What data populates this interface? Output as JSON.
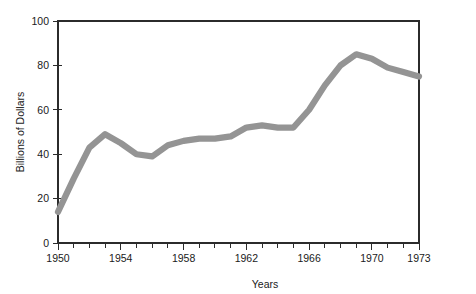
{
  "chart_data": {
    "type": "line",
    "title": "",
    "xlabel": "Years",
    "ylabel": "Billions of Dollars",
    "xlim": [
      1950,
      1973
    ],
    "ylim": [
      0,
      100
    ],
    "grid": false,
    "legend": null,
    "line_color": "#949494",
    "axis_color": "#2b2b2b",
    "x_tick_labels": [
      "1950",
      "1954",
      "1958",
      "1962",
      "1966",
      "1970",
      "1973"
    ],
    "x_tick_values": [
      1950,
      1954,
      1958,
      1962,
      1966,
      1970,
      1973
    ],
    "x_minor_ticks": [
      1950,
      1951,
      1952,
      1953,
      1954,
      1955,
      1956,
      1957,
      1958,
      1959,
      1960,
      1961,
      1962,
      1963,
      1964,
      1965,
      1966,
      1967,
      1968,
      1969,
      1970,
      1971,
      1972,
      1973
    ],
    "y_tick_labels": [
      "0",
      "20",
      "40",
      "60",
      "80",
      "100"
    ],
    "y_tick_values": [
      0,
      20,
      40,
      60,
      80,
      100
    ],
    "x": [
      1950,
      1951,
      1952,
      1953,
      1954,
      1955,
      1956,
      1957,
      1958,
      1959,
      1960,
      1961,
      1962,
      1963,
      1964,
      1965,
      1966,
      1967,
      1968,
      1969,
      1970,
      1971,
      1972,
      1973
    ],
    "values": [
      14,
      29,
      43,
      49,
      45,
      40,
      39,
      44,
      46,
      47,
      47,
      48,
      52,
      53,
      52,
      52,
      60,
      71,
      80,
      85,
      83,
      79,
      77,
      75
    ],
    "series": [
      {
        "name": "Billions of Dollars",
        "values": [
          14,
          29,
          43,
          49,
          45,
          40,
          39,
          44,
          46,
          47,
          47,
          48,
          52,
          53,
          52,
          52,
          60,
          71,
          80,
          85,
          83,
          79,
          77,
          75
        ]
      }
    ]
  }
}
